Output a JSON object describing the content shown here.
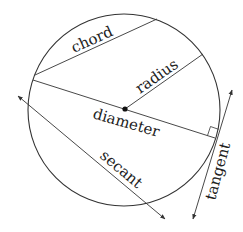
{
  "diagram": {
    "colors": {
      "stroke": "#333333",
      "text": "#222222",
      "background": "#ffffff"
    },
    "labels": {
      "chord": "chord",
      "radius": "radius",
      "diameter": "diameter",
      "secant": "secant",
      "tangent": "tangent"
    }
  }
}
